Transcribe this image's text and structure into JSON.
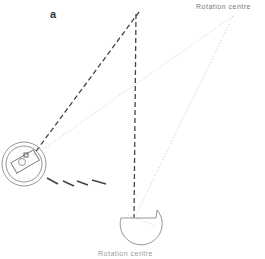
{
  "diagram": {
    "panel_label": "a",
    "rotation_label": "Rotation centre",
    "bottom_label": "Rotation centre",
    "colors": {
      "dashed_line": "#444444",
      "dotted_line": "#bbbbbb",
      "outline": "#777777"
    },
    "elements": [
      {
        "type": "dashed-line",
        "from": [
          138,
          14
        ],
        "to": [
          34,
          152
        ]
      },
      {
        "type": "dashed-line",
        "from": [
          136,
          14
        ],
        "to": [
          134,
          218
        ]
      },
      {
        "type": "dotted-line",
        "from": [
          232,
          16
        ],
        "to": [
          40,
          150
        ]
      },
      {
        "type": "dotted-line",
        "from": [
          232,
          16
        ],
        "to": [
          136,
          215
        ]
      },
      {
        "type": "circle-target",
        "center": [
          24,
          162
        ],
        "radii": [
          22,
          18
        ]
      },
      {
        "type": "half-circle-target",
        "center": [
          141,
          218
        ],
        "radius": 21
      },
      {
        "type": "motion-dashes",
        "count": 4
      }
    ]
  }
}
